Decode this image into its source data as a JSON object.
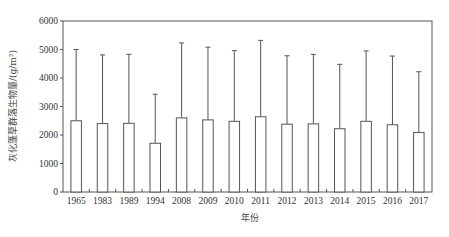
{
  "chart_data": {
    "type": "bar",
    "title": "",
    "xlabel": "年份",
    "ylabel": "灰化蓬草群落生物量/(g/m²)",
    "ylim": [
      0,
      6000
    ],
    "yticks": [
      0,
      1000,
      2000,
      3000,
      4000,
      5000,
      6000
    ],
    "grid": false,
    "legend": null,
    "error_bars": "upper only (mean + SD)",
    "categories": [
      "1965",
      "1983",
      "1989",
      "1994",
      "2008",
      "2009",
      "2010",
      "2011",
      "2012",
      "2013",
      "2014",
      "2015",
      "2016",
      "2017"
    ],
    "series": [
      {
        "name": "灰化蓬草群落生物量",
        "values": [
          2500,
          2400,
          2410,
          1710,
          2600,
          2530,
          2480,
          2640,
          2380,
          2390,
          2220,
          2480,
          2360,
          2090
        ],
        "error_upper": [
          5000,
          4810,
          4830,
          3430,
          5230,
          5080,
          4960,
          5320,
          4780,
          4830,
          4480,
          4950,
          4770,
          4220
        ]
      }
    ]
  },
  "axes": {
    "x_title": "年份",
    "y_title": "灰化蓬草群落生物量/(g/m²)"
  },
  "colors": {
    "bar_fill": "#ffffff",
    "line": "#555555",
    "text": "#333333"
  }
}
